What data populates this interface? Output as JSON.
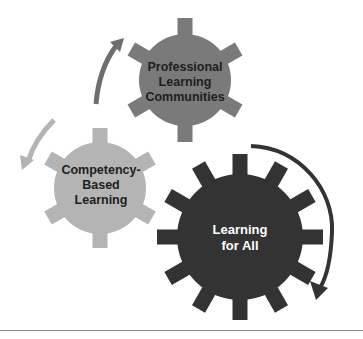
{
  "diagram": {
    "gears": [
      {
        "id": "plc",
        "lines": [
          "Professional",
          "Learning",
          "Communities"
        ],
        "color": "#7a7a7a",
        "text_color": "#1e1e1e"
      },
      {
        "id": "cbl",
        "lines": [
          "Competency-",
          "Based",
          "Learning"
        ],
        "color": "#b4b4b4",
        "text_color": "#1e1e1e"
      },
      {
        "id": "lfa",
        "lines": [
          "Learning",
          "for All"
        ],
        "color": "#333333",
        "text_color": "#ffffff"
      }
    ],
    "arrows": [
      {
        "id": "arrow-cbl-to-plc",
        "color": "#6e6e6e",
        "direction": "clockwise-up"
      },
      {
        "id": "arrow-to-cbl",
        "color": "#b4b4b4",
        "direction": "counterclockwise-down"
      },
      {
        "id": "arrow-lfa",
        "color": "#333333",
        "direction": "clockwise-down"
      }
    ]
  }
}
